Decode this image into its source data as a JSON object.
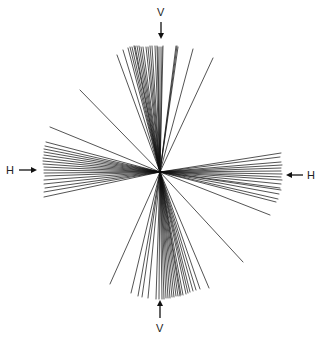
{
  "figure": {
    "center": [
      160,
      172
    ],
    "labels": {
      "top": "V",
      "bottom": "V",
      "left": "H",
      "right": "H"
    },
    "ink_color": "#111111",
    "background_color": "#ffffff"
  },
  "rays": {
    "top": [
      [
        80,
        90
      ],
      [
        117,
        55
      ],
      [
        123,
        50
      ],
      [
        128,
        48
      ],
      [
        130,
        47
      ],
      [
        132,
        47
      ],
      [
        134,
        46
      ],
      [
        135,
        46
      ],
      [
        137,
        46
      ],
      [
        139,
        46
      ],
      [
        141,
        47
      ],
      [
        143,
        47
      ],
      [
        146,
        47
      ],
      [
        148,
        47
      ],
      [
        150,
        46
      ],
      [
        152,
        46
      ],
      [
        155,
        46
      ],
      [
        157,
        46
      ],
      [
        158,
        47
      ],
      [
        160,
        47
      ],
      [
        162,
        47
      ],
      [
        163,
        46
      ],
      [
        176,
        46
      ],
      [
        177,
        46
      ],
      [
        178,
        47
      ],
      [
        193,
        49
      ],
      [
        213,
        58
      ]
    ],
    "left": [
      [
        50,
        127
      ],
      [
        46,
        142
      ],
      [
        45,
        146
      ],
      [
        44,
        149
      ],
      [
        44,
        152
      ],
      [
        44,
        155
      ],
      [
        43,
        158
      ],
      [
        43,
        161
      ],
      [
        43,
        164
      ],
      [
        44,
        167
      ],
      [
        44,
        170
      ],
      [
        44,
        173
      ],
      [
        45,
        176
      ],
      [
        44,
        180
      ],
      [
        44,
        184
      ],
      [
        45,
        188
      ],
      [
        44,
        192
      ],
      [
        44,
        197
      ]
    ],
    "right": [
      [
        281,
        153
      ],
      [
        280,
        157
      ],
      [
        281,
        162
      ],
      [
        282,
        165
      ],
      [
        281,
        168
      ],
      [
        281,
        171
      ],
      [
        282,
        174
      ],
      [
        281,
        177
      ],
      [
        282,
        180
      ],
      [
        281,
        184
      ],
      [
        280,
        188
      ],
      [
        281,
        190
      ],
      [
        279,
        194
      ],
      [
        278,
        199
      ],
      [
        276,
        202
      ],
      [
        270,
        215
      ],
      [
        243,
        262
      ]
    ],
    "bottom": [
      [
        110,
        284
      ],
      [
        131,
        293
      ],
      [
        138,
        296
      ],
      [
        142,
        297
      ],
      [
        148,
        298
      ],
      [
        156,
        299
      ],
      [
        159,
        299
      ],
      [
        162,
        299
      ],
      [
        164,
        299
      ],
      [
        166,
        298
      ],
      [
        168,
        298
      ],
      [
        170,
        298
      ],
      [
        172,
        297
      ],
      [
        174,
        297
      ],
      [
        176,
        296
      ],
      [
        178,
        296
      ],
      [
        180,
        296
      ],
      [
        181,
        295
      ],
      [
        183,
        295
      ],
      [
        186,
        294
      ],
      [
        188,
        293
      ],
      [
        190,
        292
      ],
      [
        193,
        291
      ],
      [
        196,
        290
      ],
      [
        200,
        289
      ],
      [
        209,
        288
      ]
    ]
  }
}
